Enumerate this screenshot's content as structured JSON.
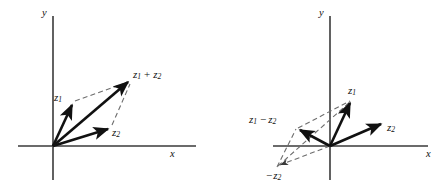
{
  "figure": {
    "background_color": "#ffffff",
    "stroke_color": "#111111",
    "dash_color": "#6d6d6d",
    "axis_color": "#3a3a3a"
  },
  "panels": [
    {
      "id": "left-panel",
      "caption": "vector-addition",
      "axes": {
        "x_label": "x",
        "y_label": "y",
        "origin": [
          53,
          146
        ]
      },
      "vectors": [
        {
          "name": "z1",
          "label": "z",
          "subscript": "1",
          "tip": [
            73,
            103
          ]
        },
        {
          "name": "z2",
          "label": "z",
          "subscript": "2",
          "tip": [
            110,
            127
          ]
        },
        {
          "name": "z1plusz2",
          "label": "z",
          "subscript": "1",
          "operator": "+",
          "label2": "z",
          "subscript2": "2",
          "tip": [
            130,
            80
          ]
        }
      ],
      "labels": {
        "z1": "z",
        "z1_sub": "1",
        "z2": "z",
        "z2_sub": "2",
        "sum_first": "z",
        "sum_first_sub": "1",
        "sum_op": "+",
        "sum_second": "z",
        "sum_second_sub": "2"
      }
    },
    {
      "id": "right-panel",
      "caption": "vector-subtraction",
      "axes": {
        "x_label": "x",
        "y_label": "y",
        "origin": [
          330,
          146
        ]
      },
      "vectors": [
        {
          "name": "z1",
          "label": "z",
          "subscript": "1",
          "tip": [
            352,
            100
          ]
        },
        {
          "name": "z2",
          "label": "z",
          "subscript": "2",
          "tip": [
            383,
            122
          ]
        },
        {
          "name": "z1minusz2",
          "label": "z",
          "subscript": "1",
          "operator": "−",
          "label2": "z",
          "subscript2": "2",
          "tip": [
            297,
            128
          ]
        },
        {
          "name": "negz2",
          "operator": "−",
          "label": "z",
          "subscript": "2",
          "tip": [
            277,
            167
          ]
        }
      ],
      "labels": {
        "z1": "z",
        "z1_sub": "1",
        "z2": "z",
        "z2_sub": "2",
        "diff_first": "z",
        "diff_first_sub": "1",
        "diff_op": "−",
        "diff_second": "z",
        "diff_second_sub": "2",
        "neg_op": "−",
        "neg_z2": "z",
        "neg_z2_sub": "2"
      }
    }
  ]
}
